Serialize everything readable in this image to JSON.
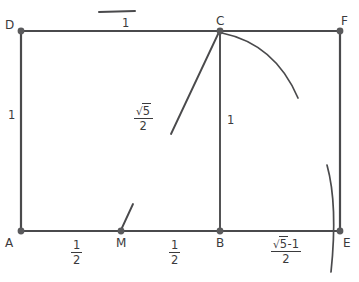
{
  "figure": {
    "colors": {
      "stroke": "#4a4a4c",
      "vertex": "#5a5a5c",
      "text": "#3a3a3c",
      "background": "#ffffff"
    },
    "points": [
      {
        "id": "A",
        "label": "A",
        "x": 21,
        "y": 231
      },
      {
        "id": "B",
        "label": "B",
        "x": 220,
        "y": 231
      },
      {
        "id": "C",
        "label": "C",
        "x": 220,
        "y": 31
      },
      {
        "id": "D",
        "label": "D",
        "x": 21,
        "y": 31
      },
      {
        "id": "E",
        "label": "E",
        "x": 340,
        "y": 231
      },
      {
        "id": "F",
        "label": "F",
        "x": 340,
        "y": 31
      },
      {
        "id": "M",
        "label": "M",
        "x": 121,
        "y": 231
      }
    ],
    "segments": [
      {
        "id": "DA",
        "from": "D",
        "to": "A",
        "measure": "1"
      },
      {
        "id": "DC",
        "from": "D",
        "to": "C",
        "measure": "1"
      },
      {
        "id": "CF",
        "from": "C",
        "to": "F",
        "measure": ""
      },
      {
        "id": "AE",
        "from": "A",
        "to": "E",
        "measure": ""
      },
      {
        "id": "FE",
        "from": "F",
        "to": "E",
        "measure": ""
      },
      {
        "id": "CB",
        "from": "C",
        "to": "B",
        "measure": "1"
      },
      {
        "id": "CM",
        "from": "C",
        "to": "M",
        "measure": "sqrt5-over-2"
      }
    ],
    "measure_labels": [
      {
        "id": "top-one",
        "text": "1",
        "x": 122,
        "y": 18,
        "kind": "plain",
        "tick": true
      },
      {
        "id": "left-one",
        "text": "1",
        "x": 8,
        "y": 110,
        "kind": "plain",
        "tick": false
      },
      {
        "id": "cb-one",
        "text": "1",
        "x": 227,
        "y": 115,
        "kind": "plain",
        "tick": false
      }
    ],
    "fraction_labels": [
      {
        "id": "am-half",
        "numerator": "1",
        "denominator": "2",
        "x": 71,
        "y": 239,
        "radical": false
      },
      {
        "id": "mb-half",
        "numerator": "1",
        "denominator": "2",
        "x": 169,
        "y": 239,
        "radical": false
      },
      {
        "id": "cm-length",
        "numerator": "5",
        "denominator": "2",
        "x": 142,
        "y": 105,
        "radical": true,
        "radical_suffix": "",
        "full_text": "√5/2"
      },
      {
        "id": "be-length",
        "numerator": "5",
        "denominator": "2",
        "x": 285,
        "y": 238,
        "radical": true,
        "radical_suffix": "-1",
        "full_text": "(√5-1)/2"
      }
    ],
    "arcs": [
      {
        "id": "arc-from-c",
        "description": "arc centered at M through C sweeping down-right",
        "path": "M 222 33 Q 275 44 298 98"
      },
      {
        "id": "arc-through-e",
        "description": "arc centered at M passing through E",
        "path": "M 327 165 Q 338 205 331 272"
      }
    ],
    "radical_symbol": "√"
  }
}
